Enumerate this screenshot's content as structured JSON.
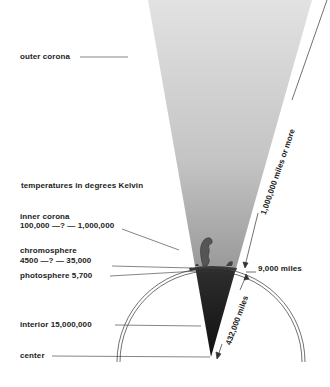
{
  "diagram": {
    "title": "temperatures in degrees Kelvin",
    "labels": {
      "outer_corona": "outer corona",
      "inner_corona": "inner corona",
      "inner_corona_temp": "100,000 —? — 1,000,000",
      "chromosphere": "chromosphere",
      "chromosphere_temp": "4500  —? — 35,000",
      "photosphere": "photosphere 5,700",
      "interior": "interior  15,000,000",
      "center": "center"
    },
    "dimensions": {
      "corona_extent": "1,000,000 miles or more",
      "chromosphere_thickness": "9,000 miles",
      "radius": "432,000 miles"
    },
    "colors": {
      "corona_light": "#dcdcdc",
      "corona_mid": "#a8a8a8",
      "interior_dark": "#1a1a1a",
      "line": "#333333"
    }
  }
}
